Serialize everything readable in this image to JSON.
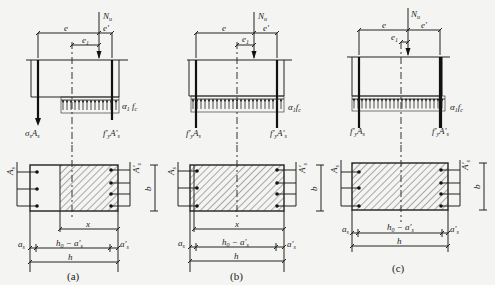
{
  "figure": {
    "panels": [
      {
        "id": "a",
        "caption": "(a)",
        "labels": {
          "axial_force": "Nu",
          "ecc_total": "e",
          "ecc_prime": "e'",
          "ecc_initial": "e1",
          "concrete_stress": "α1 fc",
          "tension_steel_force": "σs As",
          "compression_steel_force": "f'y A's",
          "tension_steel_area": "As",
          "compression_steel_area": "A's",
          "width": "b",
          "compression_depth": "x",
          "a_s": "as",
          "a_s_prime": "a's",
          "lever_arm": "h0 − a's",
          "height": "h"
        }
      },
      {
        "id": "b",
        "caption": "(b)",
        "labels": {
          "axial_force": "Nu",
          "ecc_total": "e",
          "ecc_prime": "e'",
          "ecc_initial": "e1",
          "concrete_stress": "α1 fc",
          "tension_steel_force": "f'y As",
          "compression_steel_force": "f'y A's",
          "tension_steel_area": "As",
          "compression_steel_area": "A's",
          "width": "b",
          "compression_depth": "x",
          "a_s": "as",
          "a_s_prime": "a's",
          "lever_arm": "h0 − a's",
          "height": "h"
        }
      },
      {
        "id": "c",
        "caption": "(c)",
        "labels": {
          "axial_force": "Nu",
          "ecc_total": "e",
          "ecc_prime": "e'",
          "ecc_initial": "e1",
          "concrete_stress": "α1 fc",
          "tension_steel_force": "f'y As",
          "compression_steel_force": "f'y A's",
          "tension_steel_area": "As",
          "compression_steel_area": "A's",
          "width": "b",
          "a_s": "as",
          "a_s_prime": "a's",
          "lever_arm": "h0 − a's",
          "height": "h"
        }
      }
    ]
  }
}
